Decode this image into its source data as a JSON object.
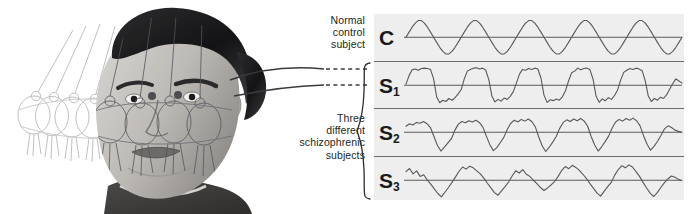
{
  "figure": {
    "kind": "smooth-pursuit-eye-tracking-figure",
    "illustration": {
      "description": "Grayscale medical illustration of a swinging pendulum shown in several ghosted positions with one solid bob, overlaid on the head of a seated subject who follows the pendulum with the eyes",
      "pendulum_ghost_positions": 4,
      "pendulum_solid_positions": 1
    }
  },
  "annotations": {
    "control_label": "Normal\ncontrol\nsubject",
    "schizophrenic_label": "Three\ndifferent\nschizophrenic\nsubjects"
  },
  "colors": {
    "panel_background": "#eeeeee",
    "divider": "#6d6d6d",
    "baseline": "#4a4a4a",
    "trace": "#58585a",
    "text": "#231f20",
    "page_background": "#ffffff"
  },
  "chart_data": {
    "type": "line",
    "title": "",
    "xlabel": "",
    "ylabel": "",
    "grid": false,
    "legend": "none",
    "xlim": [
      0,
      280
    ],
    "ylim": [
      -1,
      1
    ],
    "series": [
      {
        "name": "C",
        "label": "C",
        "subject_type": "Normal control subject",
        "waveform": "smooth sinusoid",
        "cycles": 5,
        "amplitude": 0.78,
        "noise": 0.0,
        "values": [
          0,
          0.24,
          0.47,
          0.66,
          0.78,
          0.78,
          0.66,
          0.47,
          0.24,
          0,
          -0.24,
          -0.47,
          -0.66,
          -0.78,
          -0.78,
          -0.66,
          -0.47,
          -0.24,
          0,
          0.24,
          0.47,
          0.66,
          0.78,
          0.78,
          0.66,
          0.47,
          0.24,
          0,
          -0.24,
          -0.47,
          -0.66,
          -0.78,
          -0.78,
          -0.66,
          -0.47,
          -0.24,
          0,
          0.24,
          0.47,
          0.66,
          0.78,
          0.78,
          0.66,
          0.47,
          0.24,
          0,
          -0.24,
          -0.47,
          -0.66,
          -0.78,
          -0.78,
          -0.66,
          -0.47,
          -0.24,
          0,
          0.24,
          0.47,
          0.66,
          0.78,
          0.78,
          0.66,
          0.47,
          0.24,
          0,
          -0.24,
          -0.47,
          -0.66,
          -0.78,
          -0.78,
          -0.66,
          -0.47,
          -0.24,
          0,
          0.24,
          0.47,
          0.66,
          0.78,
          0.78,
          0.66,
          0.47,
          0.24,
          0,
          -0.24,
          -0.47,
          -0.66,
          -0.78,
          -0.78,
          -0.66,
          -0.47,
          -0.24,
          0
        ]
      },
      {
        "name": "S1",
        "label": "S",
        "sublabel": "1",
        "subject_type": "Schizophrenic subject 1",
        "waveform": "square / plateau with abrupt saccadic drops",
        "cycles": 5,
        "amplitude": 0.8,
        "noise": 0.1,
        "values": [
          0.05,
          0.45,
          0.72,
          0.76,
          0.7,
          0.78,
          0.8,
          0.78,
          0.74,
          0.3,
          -0.55,
          -0.82,
          -0.7,
          -0.76,
          -0.62,
          -0.7,
          -0.58,
          -0.4,
          -0.2,
          0.3,
          0.66,
          0.74,
          0.8,
          0.82,
          0.76,
          0.8,
          0.7,
          0.26,
          -0.5,
          -0.78,
          -0.66,
          -0.74,
          -0.6,
          -0.66,
          -0.52,
          -0.3,
          0.1,
          0.52,
          0.74,
          0.7,
          0.78,
          0.74,
          0.8,
          0.76,
          0.34,
          -0.46,
          -0.8,
          -0.68,
          -0.72,
          -0.64,
          -0.7,
          -0.54,
          -0.26,
          0.2,
          0.58,
          0.66,
          0.8,
          0.72,
          0.78,
          0.8,
          0.72,
          0.28,
          -0.52,
          -0.8,
          -0.64,
          -0.72,
          -0.58,
          -0.66,
          -0.48,
          -0.22,
          0.24,
          0.6,
          0.7,
          0.78,
          0.74,
          0.8,
          0.76,
          0.68,
          0.22,
          -0.5,
          -0.76,
          -0.62,
          -0.7,
          -0.56,
          -0.62,
          -0.44,
          -0.18,
          0.08,
          0.3,
          0.2,
          0.1
        ]
      },
      {
        "name": "S2",
        "label": "S",
        "sublabel": "2",
        "subject_type": "Schizophrenic subject 2",
        "waveform": "rounded noisy peaks with deep V-shaped troughs",
        "cycles": 5,
        "amplitude": 0.85,
        "noise": 0.16,
        "values": [
          0.28,
          0.4,
          0.34,
          0.46,
          0.42,
          0.5,
          0.4,
          0.22,
          -0.2,
          -0.62,
          -0.88,
          -0.7,
          -0.5,
          -0.3,
          0.1,
          0.38,
          0.5,
          0.44,
          0.54,
          0.48,
          0.56,
          0.46,
          0.24,
          -0.18,
          -0.58,
          -0.86,
          -0.72,
          -0.48,
          -0.24,
          0.14,
          0.42,
          0.56,
          0.48,
          0.6,
          0.52,
          0.62,
          0.5,
          0.26,
          -0.22,
          -0.64,
          -0.9,
          -0.7,
          -0.46,
          -0.2,
          0.18,
          0.46,
          0.58,
          0.5,
          0.62,
          0.54,
          0.64,
          0.52,
          0.28,
          -0.2,
          -0.6,
          -0.88,
          -0.68,
          -0.44,
          -0.18,
          0.2,
          0.48,
          0.6,
          0.52,
          0.64,
          0.56,
          0.66,
          0.54,
          0.3,
          -0.16,
          -0.56,
          -0.84,
          -0.66,
          -0.42,
          -0.14,
          0.16,
          0.3,
          0.22,
          0.1,
          0.04,
          0.0
        ]
      },
      {
        "name": "S3",
        "label": "S",
        "sublabel": "3",
        "subject_type": "Schizophrenic subject 3",
        "waveform": "highly irregular, jittery, low-gain tracking with many intrusive saccades",
        "cycles": 5,
        "amplitude": 0.72,
        "noise": 0.26,
        "values": [
          0.4,
          0.55,
          0.3,
          0.44,
          0.18,
          0.26,
          0.02,
          -0.18,
          -0.4,
          -0.62,
          -0.78,
          -0.56,
          -0.34,
          -0.1,
          0.16,
          0.42,
          0.62,
          0.52,
          0.66,
          0.58,
          0.44,
          0.3,
          0.1,
          -0.14,
          -0.36,
          -0.58,
          -0.7,
          -0.5,
          -0.3,
          -0.08,
          0.2,
          0.44,
          0.34,
          0.5,
          0.28,
          0.18,
          0.0,
          -0.16,
          -0.34,
          -0.48,
          -0.36,
          -0.22,
          -0.06,
          0.18,
          0.46,
          0.64,
          0.54,
          0.7,
          0.6,
          0.46,
          0.28,
          0.08,
          -0.16,
          -0.38,
          -0.6,
          -0.74,
          -0.52,
          -0.3,
          -0.1,
          0.24,
          0.5,
          0.68,
          0.58,
          0.72,
          0.62,
          0.4,
          0.18,
          -0.1,
          -0.36,
          -0.6,
          -0.76,
          -0.58,
          -0.34,
          -0.12,
          0.06,
          0.2,
          0.14,
          0.04,
          -0.02
        ]
      }
    ]
  }
}
